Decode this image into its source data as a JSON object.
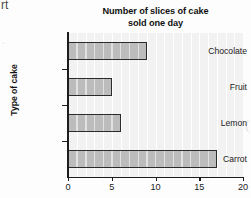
{
  "page": {
    "corner_text_fragment": "rt",
    "left_margin_artifact": ".",
    "right_edge_artifact": "("
  },
  "chart_data": {
    "type": "bar",
    "orientation": "horizontal",
    "title": "Number of slices of cake sold one day",
    "title_line1": "Number of slices of cake",
    "title_line2": "sold one day",
    "xlabel": "",
    "ylabel": "Type of cake",
    "categories": [
      "Chocolate",
      "Fruit",
      "Lemon",
      "Carrot"
    ],
    "values": [
      9,
      5,
      6,
      17
    ],
    "xlim": [
      0,
      20
    ],
    "xticks": [
      0,
      5,
      10,
      15,
      20
    ],
    "xtick_labels": [
      "0",
      "5",
      "10",
      "15",
      "20"
    ],
    "minor_tick_step": 1,
    "grid": "vertical-minor",
    "legend": null,
    "bar_fill_color": "#bcbcbc",
    "bar_edge_color": "#2b2b2b",
    "plot_background_color": "#f2f2f2",
    "gridline_color": "#ffffff"
  }
}
